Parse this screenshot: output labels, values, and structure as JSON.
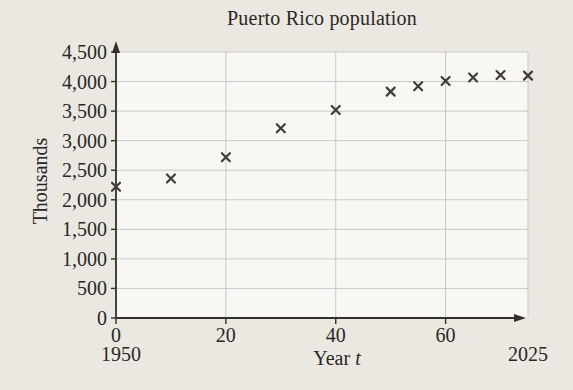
{
  "chart_data": {
    "type": "scatter",
    "title": "Puerto Rico population",
    "ylabel": "Thousands",
    "xlabel": {
      "text": "Year",
      "var": "t"
    },
    "marker": "x",
    "grid": true,
    "x": {
      "range": [
        0,
        75
      ],
      "ticks": [
        {
          "t": 0,
          "label": "0"
        },
        {
          "t": 20,
          "label": "20"
        },
        {
          "t": 40,
          "label": "40"
        },
        {
          "t": 60,
          "label": "60"
        }
      ],
      "year_labels": [
        {
          "t": 0,
          "label": "1950"
        },
        {
          "t": 75,
          "label": "2025"
        }
      ],
      "gridline_t": [
        20,
        40,
        60,
        75
      ]
    },
    "y": {
      "range": [
        0,
        4500
      ],
      "tick_step": 500,
      "ticks": [
        {
          "v": 0,
          "label": "0"
        },
        {
          "v": 500,
          "label": "500"
        },
        {
          "v": 1000,
          "label": "1,000"
        },
        {
          "v": 1500,
          "label": "1,500"
        },
        {
          "v": 2000,
          "label": "2,000"
        },
        {
          "v": 2500,
          "label": "2,500"
        },
        {
          "v": 3000,
          "label": "3,000"
        },
        {
          "v": 3500,
          "label": "3,500"
        },
        {
          "v": 4000,
          "label": "4,000"
        },
        {
          "v": 4500,
          "label": "4,500"
        }
      ],
      "gridline_values": [
        500,
        1000,
        1500,
        2000,
        2500,
        3000,
        3500,
        4000,
        4500
      ]
    },
    "points": [
      {
        "t": 0,
        "population_thousands": 2220
      },
      {
        "t": 10,
        "population_thousands": 2360
      },
      {
        "t": 20,
        "population_thousands": 2720
      },
      {
        "t": 30,
        "population_thousands": 3210
      },
      {
        "t": 40,
        "population_thousands": 3520
      },
      {
        "t": 50,
        "population_thousands": 3830
      },
      {
        "t": 55,
        "population_thousands": 3920
      },
      {
        "t": 60,
        "population_thousands": 4010
      },
      {
        "t": 65,
        "population_thousands": 4070
      },
      {
        "t": 70,
        "population_thousands": 4110
      },
      {
        "t": 75,
        "population_thousands": 4100
      }
    ],
    "colors": {
      "marker": "#3f3c38",
      "grid": "#c6c9cb",
      "axis": "#33302b",
      "text": "#2a2722",
      "plot_background": "#f8f7f3",
      "page_background": "#ebe8e2"
    }
  }
}
